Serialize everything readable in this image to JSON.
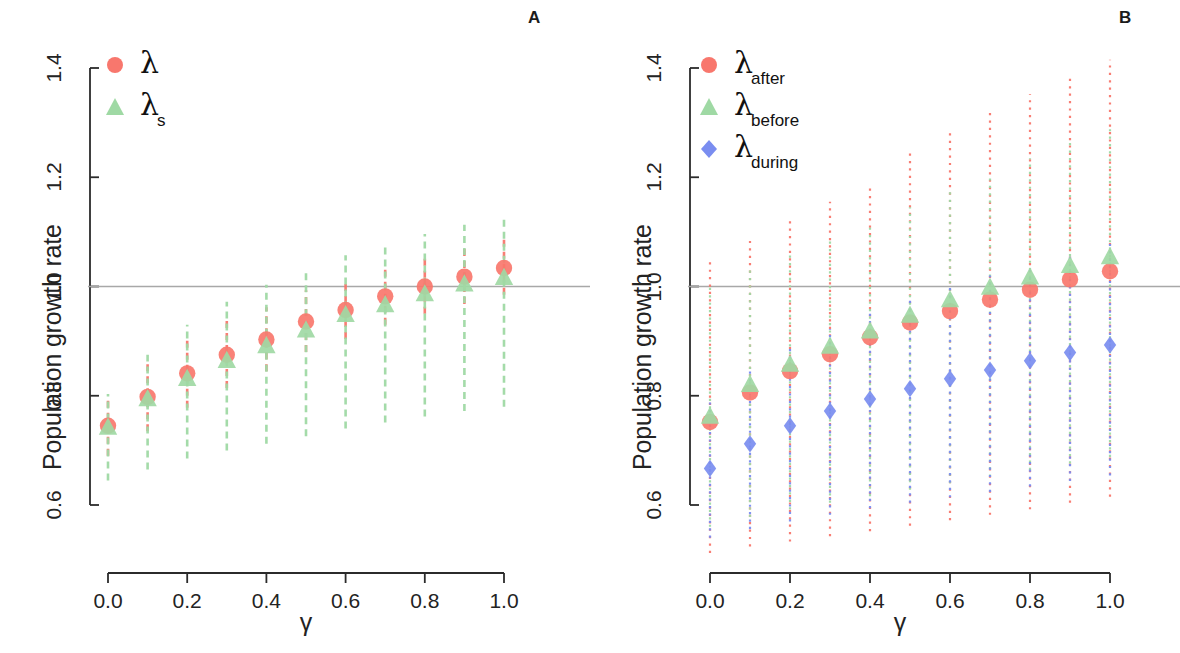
{
  "figure": {
    "width": 1180,
    "height": 653,
    "background": "#ffffff"
  },
  "colors": {
    "red": "#f8776d",
    "green": "#9fd9a4",
    "blue": "#7a8df0",
    "axis": "#2b2b2b",
    "reference_line": "#a8a8a8",
    "text": "#232323"
  },
  "panels": [
    {
      "id": "A",
      "letter": "A",
      "ylabel": "Population growth rate",
      "xlabel": "γ",
      "ylim": [
        0.6,
        1.4
      ],
      "xlim": [
        0.0,
        1.0
      ],
      "yticks": [
        "0.6",
        "0.8",
        "1.0",
        "1.2",
        "1.4"
      ],
      "ytick_values": [
        0.6,
        0.8,
        1.0,
        1.2,
        1.4
      ],
      "xticks": [
        "0.0",
        "0.2",
        "0.4",
        "0.6",
        "0.8",
        "1.0"
      ],
      "xtick_values": [
        0.0,
        0.2,
        0.4,
        0.6,
        0.8,
        1.0
      ],
      "reference_line": 1.0,
      "legend": [
        {
          "marker": "circle",
          "color": "#f8776d",
          "base": "λ",
          "sub": ""
        },
        {
          "marker": "triangle",
          "color": "#9fd9a4",
          "base": "λ",
          "sub": "s"
        }
      ]
    },
    {
      "id": "B",
      "letter": "B",
      "ylabel": "Population growth rate",
      "xlabel": "γ",
      "ylim": [
        0.6,
        1.4
      ],
      "xlim": [
        0.0,
        1.0
      ],
      "yticks": [
        "0.6",
        "0.8",
        "1.0",
        "1.2",
        "1.4"
      ],
      "ytick_values": [
        0.6,
        0.8,
        1.0,
        1.2,
        1.4
      ],
      "xticks": [
        "0.0",
        "0.2",
        "0.4",
        "0.6",
        "0.8",
        "1.0"
      ],
      "xtick_values": [
        0.0,
        0.2,
        0.4,
        0.6,
        0.8,
        1.0
      ],
      "reference_line": 1.0,
      "legend": [
        {
          "marker": "circle",
          "color": "#f8776d",
          "base": "λ",
          "sub": "after"
        },
        {
          "marker": "triangle",
          "color": "#9fd9a4",
          "base": "λ",
          "sub": "before"
        },
        {
          "marker": "diamond",
          "color": "#7a8df0",
          "base": "λ",
          "sub": "during"
        }
      ]
    }
  ],
  "chart_data": [
    {
      "type": "scatter",
      "panel": "A",
      "title": "A",
      "xlabel": "γ",
      "ylabel": "Population growth rate",
      "xlim": [
        0.0,
        1.0
      ],
      "ylim": [
        0.6,
        1.4
      ],
      "grid": false,
      "legend_position": "top-left",
      "reference_line_y": 1.0,
      "x": [
        0.0,
        0.1,
        0.2,
        0.3,
        0.4,
        0.5,
        0.6,
        0.7,
        0.8,
        0.9,
        1.0
      ],
      "series": [
        {
          "name": "λ",
          "marker": "circle",
          "color": "#f8776d",
          "errorbar_style": "dashed",
          "values": [
            0.745,
            0.798,
            0.841,
            0.875,
            0.903,
            0.936,
            0.957,
            0.982,
            1.0,
            1.018,
            1.034
          ],
          "lower": [
            0.69,
            0.735,
            0.778,
            0.814,
            0.845,
            0.88,
            0.904,
            0.93,
            0.95,
            0.968,
            0.985
          ],
          "upper": [
            0.8,
            0.862,
            0.905,
            0.937,
            0.962,
            0.993,
            1.012,
            1.036,
            1.052,
            1.07,
            1.086
          ]
        },
        {
          "name": "λ_s",
          "marker": "triangle",
          "color": "#9fd9a4",
          "errorbar_style": "dashed",
          "values": [
            0.742,
            0.794,
            0.831,
            0.864,
            0.891,
            0.92,
            0.948,
            0.966,
            0.986,
            1.004,
            1.016
          ],
          "lower": [
            0.645,
            0.665,
            0.685,
            0.7,
            0.712,
            0.726,
            0.74,
            0.751,
            0.762,
            0.772,
            0.78
          ],
          "upper": [
            0.803,
            0.875,
            0.93,
            0.972,
            1.003,
            1.032,
            1.057,
            1.078,
            1.096,
            1.113,
            1.128
          ]
        }
      ]
    },
    {
      "type": "scatter",
      "panel": "B",
      "title": "B",
      "xlabel": "γ",
      "ylabel": "Population growth rate",
      "xlim": [
        0.0,
        1.0
      ],
      "ylim": [
        0.6,
        1.4
      ],
      "grid": false,
      "legend_position": "top-left",
      "reference_line_y": 1.0,
      "x": [
        0.0,
        0.1,
        0.2,
        0.3,
        0.4,
        0.5,
        0.6,
        0.7,
        0.8,
        0.9,
        1.0
      ],
      "series": [
        {
          "name": "λ_after",
          "marker": "circle",
          "color": "#f8776d",
          "errorbar_style": "dotted",
          "values": [
            0.752,
            0.806,
            0.845,
            0.876,
            0.907,
            0.934,
            0.955,
            0.976,
            0.994,
            1.013,
            1.028
          ],
          "lower": [
            0.512,
            0.524,
            0.533,
            0.543,
            0.552,
            0.562,
            0.572,
            0.582,
            0.592,
            0.604,
            0.615
          ],
          "upper": [
            1.048,
            1.086,
            1.122,
            1.155,
            1.186,
            1.245,
            1.282,
            1.32,
            1.352,
            1.386,
            1.415
          ]
        },
        {
          "name": "λ_before",
          "marker": "triangle",
          "color": "#9fd9a4",
          "errorbar_style": "dotted",
          "values": [
            0.762,
            0.82,
            0.857,
            0.89,
            0.918,
            0.947,
            0.975,
            0.998,
            1.017,
            1.038,
            1.054
          ],
          "lower": [
            0.56,
            0.578,
            0.592,
            0.604,
            0.616,
            0.628,
            0.64,
            0.652,
            0.664,
            0.676,
            0.688
          ],
          "upper": [
            1.0,
            1.03,
            1.06,
            1.09,
            1.115,
            1.145,
            1.175,
            1.205,
            1.235,
            1.265,
            1.29
          ]
        },
        {
          "name": "λ_during",
          "marker": "diamond",
          "color": "#7a8df0",
          "errorbar_style": "dotted",
          "values": [
            0.667,
            0.712,
            0.745,
            0.772,
            0.794,
            0.813,
            0.831,
            0.847,
            0.864,
            0.879,
            0.893
          ],
          "lower": [
            0.54,
            0.556,
            0.57,
            0.582,
            0.594,
            0.604,
            0.614,
            0.624,
            0.634,
            0.644,
            0.654
          ],
          "upper": [
            0.795,
            0.85,
            0.89,
            0.922,
            0.95,
            0.975,
            0.998,
            1.02,
            1.04,
            1.06,
            1.078
          ]
        }
      ]
    }
  ]
}
